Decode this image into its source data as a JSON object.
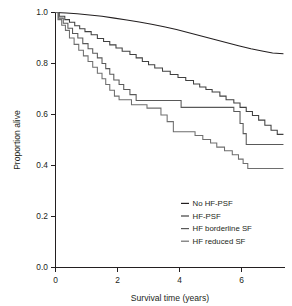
{
  "chart_data": {
    "type": "line",
    "subtype": "kaplan-meier-survival",
    "title": "",
    "xlabel": "Survival time (years)",
    "ylabel": "Proportion alive",
    "xlim": [
      0,
      7.4
    ],
    "ylim": [
      0,
      1.0
    ],
    "xticks": [
      0,
      2,
      4,
      6
    ],
    "xtick_labels": [
      "0",
      "2",
      "4",
      "6"
    ],
    "yticks": [
      0.0,
      0.2,
      0.4,
      0.6,
      0.8,
      1.0
    ],
    "ytick_labels": [
      "0.0",
      "0.2",
      "0.4",
      "0.6",
      "0.8",
      "1.0"
    ],
    "grid": false,
    "legend_position": "lower right",
    "series": [
      {
        "name": "No HF-PSF",
        "color": "#231f20",
        "final_value": 0.84,
        "points": [
          [
            0.0,
            1.0
          ],
          [
            0.35,
            0.998
          ],
          [
            0.7,
            0.995
          ],
          [
            1.1,
            0.99
          ],
          [
            1.5,
            0.985
          ],
          [
            1.9,
            0.978
          ],
          [
            2.3,
            0.971
          ],
          [
            2.7,
            0.963
          ],
          [
            3.1,
            0.954
          ],
          [
            3.5,
            0.944
          ],
          [
            3.9,
            0.933
          ],
          [
            4.3,
            0.921
          ],
          [
            4.7,
            0.908
          ],
          [
            5.1,
            0.895
          ],
          [
            5.5,
            0.882
          ],
          [
            5.9,
            0.87
          ],
          [
            6.3,
            0.858
          ],
          [
            6.7,
            0.848
          ],
          [
            7.0,
            0.841
          ],
          [
            7.35,
            0.838
          ]
        ]
      },
      {
        "name": "HF-PSF",
        "color": "#404040",
        "final_value": 0.52,
        "points": [
          [
            0.0,
            1.0
          ],
          [
            0.12,
            1.0
          ],
          [
            0.12,
            0.985
          ],
          [
            0.3,
            0.985
          ],
          [
            0.3,
            0.972
          ],
          [
            0.45,
            0.972
          ],
          [
            0.45,
            0.962
          ],
          [
            0.62,
            0.962
          ],
          [
            0.62,
            0.948
          ],
          [
            0.78,
            0.948
          ],
          [
            0.78,
            0.936
          ],
          [
            0.95,
            0.936
          ],
          [
            0.95,
            0.925
          ],
          [
            1.15,
            0.925
          ],
          [
            1.15,
            0.913
          ],
          [
            1.35,
            0.913
          ],
          [
            1.35,
            0.898
          ],
          [
            1.55,
            0.898
          ],
          [
            1.55,
            0.886
          ],
          [
            1.75,
            0.886
          ],
          [
            1.75,
            0.873
          ],
          [
            1.95,
            0.873
          ],
          [
            1.95,
            0.861
          ],
          [
            2.15,
            0.861
          ],
          [
            2.15,
            0.848
          ],
          [
            2.4,
            0.848
          ],
          [
            2.4,
            0.835
          ],
          [
            2.6,
            0.835
          ],
          [
            2.6,
            0.822
          ],
          [
            2.8,
            0.822
          ],
          [
            2.8,
            0.808
          ],
          [
            3.0,
            0.808
          ],
          [
            3.0,
            0.795
          ],
          [
            3.2,
            0.795
          ],
          [
            3.2,
            0.782
          ],
          [
            3.45,
            0.782
          ],
          [
            3.45,
            0.77
          ],
          [
            3.7,
            0.77
          ],
          [
            3.7,
            0.757
          ],
          [
            3.95,
            0.757
          ],
          [
            3.95,
            0.745
          ],
          [
            4.2,
            0.745
          ],
          [
            4.2,
            0.733
          ],
          [
            4.45,
            0.733
          ],
          [
            4.45,
            0.72
          ],
          [
            4.65,
            0.72
          ],
          [
            4.65,
            0.708
          ],
          [
            4.85,
            0.708
          ],
          [
            4.85,
            0.698
          ],
          [
            5.05,
            0.698
          ],
          [
            5.05,
            0.688
          ],
          [
            5.3,
            0.688
          ],
          [
            5.3,
            0.672
          ],
          [
            5.5,
            0.672
          ],
          [
            5.5,
            0.658
          ],
          [
            5.75,
            0.658
          ],
          [
            5.75,
            0.645
          ],
          [
            5.95,
            0.645
          ],
          [
            5.95,
            0.628
          ],
          [
            6.15,
            0.628
          ],
          [
            6.15,
            0.612
          ],
          [
            6.35,
            0.612
          ],
          [
            6.35,
            0.596
          ],
          [
            6.55,
            0.596
          ],
          [
            6.55,
            0.578
          ],
          [
            6.75,
            0.578
          ],
          [
            6.75,
            0.558
          ],
          [
            6.95,
            0.558
          ],
          [
            6.95,
            0.538
          ],
          [
            7.15,
            0.538
          ],
          [
            7.15,
            0.522
          ],
          [
            7.35,
            0.522
          ]
        ]
      },
      {
        "name": "HF borderline SF",
        "color": "#595959",
        "final_value": 0.48,
        "points": [
          [
            0.0,
            1.0
          ],
          [
            0.1,
            1.0
          ],
          [
            0.1,
            0.978
          ],
          [
            0.25,
            0.978
          ],
          [
            0.25,
            0.958
          ],
          [
            0.4,
            0.958
          ],
          [
            0.4,
            0.938
          ],
          [
            0.55,
            0.938
          ],
          [
            0.55,
            0.918
          ],
          [
            0.72,
            0.918
          ],
          [
            0.72,
            0.9
          ],
          [
            0.88,
            0.9
          ],
          [
            0.88,
            0.878
          ],
          [
            1.05,
            0.878
          ],
          [
            1.05,
            0.858
          ],
          [
            1.2,
            0.858
          ],
          [
            1.2,
            0.84
          ],
          [
            1.35,
            0.84
          ],
          [
            1.35,
            0.822
          ],
          [
            1.5,
            0.822
          ],
          [
            1.5,
            0.8
          ],
          [
            1.62,
            0.8
          ],
          [
            1.62,
            0.78
          ],
          [
            1.75,
            0.78
          ],
          [
            1.75,
            0.758
          ],
          [
            1.88,
            0.758
          ],
          [
            1.88,
            0.735
          ],
          [
            2.05,
            0.735
          ],
          [
            2.05,
            0.718
          ],
          [
            2.2,
            0.718
          ],
          [
            2.2,
            0.698
          ],
          [
            2.4,
            0.698
          ],
          [
            2.4,
            0.678
          ],
          [
            2.6,
            0.678
          ],
          [
            2.6,
            0.655
          ],
          [
            4.05,
            0.655
          ],
          [
            4.05,
            0.628
          ],
          [
            5.75,
            0.628
          ],
          [
            5.75,
            0.612
          ],
          [
            5.95,
            0.612
          ],
          [
            5.95,
            0.565
          ],
          [
            6.05,
            0.565
          ],
          [
            6.05,
            0.525
          ],
          [
            6.15,
            0.525
          ],
          [
            6.15,
            0.482
          ],
          [
            7.35,
            0.482
          ]
        ]
      },
      {
        "name": "HF reduced SF",
        "color": "#6e6e6e",
        "final_value": 0.39,
        "points": [
          [
            0.0,
            1.0
          ],
          [
            0.08,
            1.0
          ],
          [
            0.08,
            0.972
          ],
          [
            0.2,
            0.972
          ],
          [
            0.2,
            0.95
          ],
          [
            0.32,
            0.95
          ],
          [
            0.32,
            0.93
          ],
          [
            0.45,
            0.93
          ],
          [
            0.45,
            0.9
          ],
          [
            0.6,
            0.9
          ],
          [
            0.6,
            0.875
          ],
          [
            0.75,
            0.875
          ],
          [
            0.75,
            0.852
          ],
          [
            0.9,
            0.852
          ],
          [
            0.9,
            0.83
          ],
          [
            1.05,
            0.83
          ],
          [
            1.05,
            0.808
          ],
          [
            1.2,
            0.808
          ],
          [
            1.2,
            0.785
          ],
          [
            1.35,
            0.785
          ],
          [
            1.35,
            0.762
          ],
          [
            1.5,
            0.762
          ],
          [
            1.5,
            0.74
          ],
          [
            1.62,
            0.74
          ],
          [
            1.62,
            0.718
          ],
          [
            1.75,
            0.718
          ],
          [
            1.75,
            0.695
          ],
          [
            1.9,
            0.695
          ],
          [
            1.9,
            0.672
          ],
          [
            2.05,
            0.672
          ],
          [
            2.05,
            0.658
          ],
          [
            2.45,
            0.658
          ],
          [
            2.45,
            0.638
          ],
          [
            2.95,
            0.638
          ],
          [
            2.95,
            0.625
          ],
          [
            3.4,
            0.625
          ],
          [
            3.4,
            0.598
          ],
          [
            3.6,
            0.598
          ],
          [
            3.6,
            0.572
          ],
          [
            3.8,
            0.572
          ],
          [
            3.8,
            0.532
          ],
          [
            4.5,
            0.532
          ],
          [
            4.5,
            0.518
          ],
          [
            4.75,
            0.518
          ],
          [
            4.75,
            0.502
          ],
          [
            5.0,
            0.502
          ],
          [
            5.0,
            0.488
          ],
          [
            5.2,
            0.488
          ],
          [
            5.2,
            0.472
          ],
          [
            5.45,
            0.472
          ],
          [
            5.45,
            0.458
          ],
          [
            5.7,
            0.458
          ],
          [
            5.7,
            0.442
          ],
          [
            5.9,
            0.442
          ],
          [
            5.9,
            0.425
          ],
          [
            6.05,
            0.425
          ],
          [
            6.05,
            0.408
          ],
          [
            6.2,
            0.408
          ],
          [
            6.2,
            0.388
          ],
          [
            7.35,
            0.388
          ]
        ]
      }
    ]
  },
  "axes": {
    "ylabel": "Proportion alive",
    "xlabel": "Survival time (years)",
    "ytick_labels": [
      "1.0",
      "0.8",
      "0.6",
      "0.4",
      "0.2",
      "0.0"
    ],
    "xtick_labels": [
      "0",
      "2",
      "4",
      "6"
    ]
  },
  "legend": {
    "items": [
      {
        "label": "No HF-PSF",
        "color": "#231f20"
      },
      {
        "label": "HF-PSF",
        "color": "#404040"
      },
      {
        "label": "HF borderline SF",
        "color": "#595959"
      },
      {
        "label": "HF reduced SF",
        "color": "#6e6e6e"
      }
    ]
  }
}
